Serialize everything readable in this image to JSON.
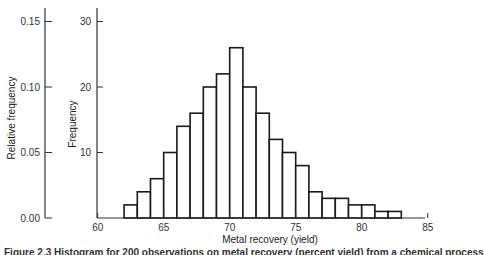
{
  "chart_data": {
    "type": "bar",
    "title": "",
    "xlabel": "Metal recovery (yield)",
    "ylabel": "Frequency",
    "ylabel_secondary": "Relative frequency",
    "bin_edges": [
      62,
      63,
      64,
      65,
      66,
      67,
      68,
      69,
      70,
      71,
      72,
      73,
      74,
      75,
      76,
      77,
      78,
      79,
      80,
      81,
      82,
      83
    ],
    "categories": [
      "62-63",
      "63-64",
      "64-65",
      "65-66",
      "66-67",
      "67-68",
      "68-69",
      "69-70",
      "70-71",
      "71-72",
      "72-73",
      "73-74",
      "74-75",
      "75-76",
      "76-77",
      "77-78",
      "78-79",
      "79-80",
      "80-81",
      "81-82",
      "82-83"
    ],
    "values": [
      2,
      4,
      6,
      10,
      14,
      16,
      20,
      22,
      26,
      20,
      16,
      12,
      10,
      8,
      4,
      3,
      3,
      2,
      2,
      1,
      1
    ],
    "xlim": [
      60,
      85
    ],
    "ylim": [
      0,
      32
    ],
    "x_ticks": [
      "60",
      "65",
      "70",
      "75",
      "80",
      "85"
    ],
    "y_ticks": [
      "10",
      "20",
      "30"
    ],
    "y2_ticks": [
      "0.00",
      "0.05",
      "0.10",
      "0.15"
    ],
    "grid": false,
    "legend": null
  },
  "caption": "Figure 2.3   Histogram for 200 observations on metal recovery (percent yield) from a chemical process"
}
